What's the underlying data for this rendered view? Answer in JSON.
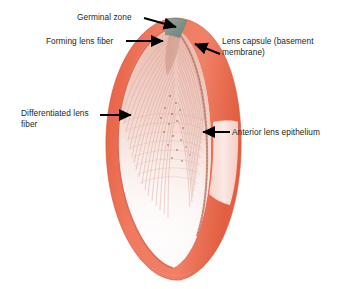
{
  "figure": {
    "background_color": "#ffffff",
    "colors": {
      "capsule": "#ec6d52",
      "capsule_dark": "#d8543c",
      "capsule_light": "#f4927c",
      "germinal_zone": "#8a9a91",
      "germinal_zone_dark": "#6f8179",
      "fiber": "#d99c8f",
      "fiber_pale": "#f0cfc6",
      "nucleus": "#9c5f4e",
      "interior": "#fbf7f6",
      "label_text": "#231f20",
      "arrow": "#000000"
    }
  },
  "labels": [
    {
      "id": "germinal-zone",
      "text": "Germinal zone",
      "position": "top-center-left",
      "arrow_direction": "down-right"
    },
    {
      "id": "forming-lens-fiber",
      "text": "Forming lens fiber",
      "position": "upper-left",
      "arrow_direction": "right"
    },
    {
      "id": "lens-capsule",
      "text": "Lens capsule (basement\nmembrane)",
      "position": "upper-right",
      "arrow_direction": "down-left"
    },
    {
      "id": "differentiated-lens-fiber",
      "text": "Differentiated lens\nfiber",
      "position": "middle-left",
      "arrow_direction": "right"
    },
    {
      "id": "anterior-lens-epithelium",
      "text": "Anterior lens epithelium",
      "position": "middle-right",
      "arrow_direction": "left"
    }
  ],
  "structures": [
    {
      "id": "lens-body",
      "name": "Lens body"
    },
    {
      "id": "lens-capsule-shell",
      "name": "Lens capsule (basement membrane)"
    },
    {
      "id": "germinal-zone-band",
      "name": "Germinal zone"
    },
    {
      "id": "anterior-epithelium-column",
      "name": "Anterior lens epithelium"
    },
    {
      "id": "lens-fibers",
      "name": "Lens fibers"
    },
    {
      "id": "capsule-cutaway-window",
      "name": "Capsule cut-away window"
    }
  ]
}
